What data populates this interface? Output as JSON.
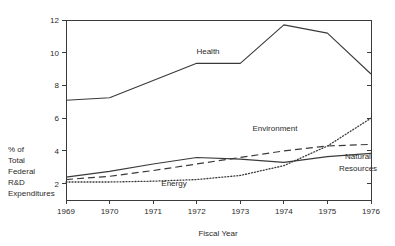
{
  "figure": {
    "title_partial": "",
    "background_color": "#ffffff",
    "line_color": "#3a3a3a",
    "text_color": "#2b2b2b"
  },
  "chart_data": {
    "type": "line",
    "title": "",
    "xlabel": "Fiscal Year",
    "ylabel": "% of Total Federal R&D Expenditures",
    "ylabel_lines": [
      "% of",
      "Total",
      "Federal",
      "R&D",
      "Expenditures"
    ],
    "categories": [
      1969,
      1970,
      1971,
      1972,
      1973,
      1974,
      1975,
      1976
    ],
    "xticklabels": [
      "1969",
      "1970",
      "1971",
      "1972",
      "1973",
      "1974",
      "1975",
      "1976"
    ],
    "yticks": [
      2,
      4,
      6,
      8,
      10,
      12
    ],
    "yticklabels": [
      "2",
      "4",
      "6",
      "8",
      "10",
      "12"
    ],
    "xlim": [
      1969,
      1976
    ],
    "ylim": [
      1.0,
      12.0
    ],
    "grid": false,
    "legend": "inline-labels",
    "series": [
      {
        "name": "Health",
        "style": "solid",
        "label": "Health",
        "values": [
          7.1,
          7.25,
          8.3,
          9.35,
          9.35,
          11.7,
          11.2,
          8.7
        ]
      },
      {
        "name": "Environment",
        "style": "dashed",
        "label": "Environment",
        "values": [
          2.25,
          2.45,
          2.8,
          3.2,
          3.6,
          4.0,
          4.3,
          4.4
        ]
      },
      {
        "name": "Natural Resources",
        "style": "solid",
        "label": "Natural Resources",
        "label_lines": [
          "Natural",
          "Resources"
        ],
        "values": [
          2.4,
          2.75,
          3.2,
          3.6,
          3.5,
          3.3,
          3.65,
          3.85
        ]
      },
      {
        "name": "Energy",
        "style": "dotted",
        "label": "Energy",
        "values": [
          2.1,
          2.1,
          2.15,
          2.25,
          2.5,
          3.1,
          4.3,
          6.0
        ]
      }
    ],
    "annotations": [
      {
        "text": "Health",
        "series": "Health"
      },
      {
        "text": "Environment",
        "series": "Environment"
      },
      {
        "text": "Natural Resources",
        "series": "Natural Resources"
      },
      {
        "text": "Energy",
        "series": "Energy"
      }
    ]
  }
}
